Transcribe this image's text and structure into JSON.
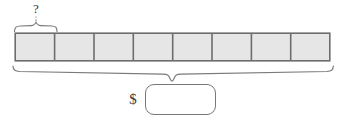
{
  "diagram": {
    "type": "tape-diagram",
    "unknown_part_label": "?",
    "currency_symbol": "$",
    "answer_value": "",
    "answer_placeholder": "",
    "cell_count": 8,
    "cells": [
      {
        "index": 1,
        "label": ""
      },
      {
        "index": 2,
        "label": ""
      },
      {
        "index": 3,
        "label": ""
      },
      {
        "index": 4,
        "label": ""
      },
      {
        "index": 5,
        "label": ""
      },
      {
        "index": 6,
        "label": ""
      },
      {
        "index": 7,
        "label": ""
      },
      {
        "index": 8,
        "label": ""
      }
    ],
    "top_brace": {
      "spans_cells": 1,
      "label": "?",
      "direction": "up"
    },
    "bottom_brace": {
      "spans_cells": 8,
      "direction": "down",
      "points_to": "answer-box"
    },
    "colors": {
      "cell_fill": "#e6e6e6",
      "cell_border": "#6d6d6d",
      "brace_stroke": "#7a7a7a",
      "box_border": "#777777",
      "background": "#ffffff",
      "text": "#3a3a3a"
    }
  }
}
